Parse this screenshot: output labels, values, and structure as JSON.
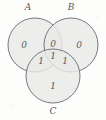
{
  "figure": {
    "background_color": "#fdfdfc",
    "circle_fill": "#e9e9e6",
    "circle_stroke": "#6b6b70",
    "text_color": "#5a5a5e"
  },
  "sets": [
    {
      "id": "A",
      "label": "A",
      "label_x": 28,
      "label_y": 7,
      "cx": 35,
      "cy": 45,
      "r": 27
    },
    {
      "id": "B",
      "label": "B",
      "label_x": 71,
      "label_y": 7,
      "cx": 71,
      "cy": 45,
      "r": 27
    },
    {
      "id": "C",
      "label": "C",
      "label_x": 53,
      "label_y": 111,
      "cx": 53,
      "cy": 76,
      "r": 27
    }
  ],
  "regions": [
    {
      "id": "A-only",
      "name": "a-only-region",
      "value": "0",
      "x": 24,
      "y": 45
    },
    {
      "id": "AB",
      "name": "a-b-region",
      "value": "0",
      "x": 53,
      "y": 44
    },
    {
      "id": "B-only",
      "name": "b-only-region",
      "value": "0",
      "x": 79,
      "y": 45
    },
    {
      "id": "AC",
      "name": "a-c-region",
      "value": "1",
      "x": 41,
      "y": 61
    },
    {
      "id": "ABC",
      "name": "a-b-c-region",
      "value": "1",
      "x": 53,
      "y": 56
    },
    {
      "id": "BC",
      "name": "b-c-region",
      "value": "1",
      "x": 65,
      "y": 61
    },
    {
      "id": "C-only",
      "name": "c-only-region",
      "value": "1",
      "x": 53,
      "y": 86
    }
  ],
  "chart_data": {
    "type": "table",
    "categories": [
      "A only",
      "A∩B",
      "B only",
      "A∩C",
      "A∩B∩C",
      "B∩C",
      "C only"
    ],
    "values": [
      0,
      0,
      0,
      1,
      1,
      1,
      1
    ],
    "legend": [
      "A",
      "B",
      "C"
    ],
    "xlabel": "",
    "ylabel": ""
  }
}
